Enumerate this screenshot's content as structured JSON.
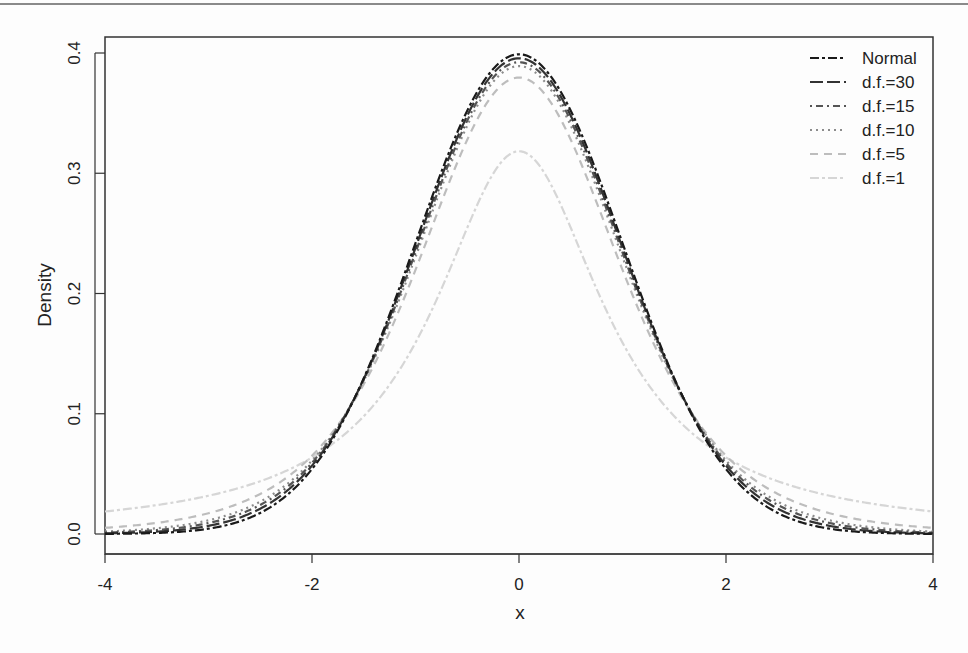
{
  "chart_data": {
    "type": "line",
    "title": "",
    "xlabel": "x",
    "ylabel": "Density",
    "xlim": [
      -4,
      4
    ],
    "ylim": [
      0,
      0.4
    ],
    "x_ticks": [
      "-4",
      "-2",
      "0",
      "2",
      "4"
    ],
    "y_ticks": [
      "0.0",
      "0.1",
      "0.2",
      "0.3",
      "0.4"
    ],
    "grid": false,
    "legend_position": "top-right (inside)",
    "x": [
      -4,
      -3.5,
      -3,
      -2.5,
      -2,
      -1.5,
      -1,
      -0.5,
      0,
      0.5,
      1,
      1.5,
      2,
      2.5,
      3,
      3.5,
      4
    ],
    "series": [
      {
        "name": "Normal",
        "df": null,
        "color": "#1a1a1a",
        "dash": "twodash",
        "values": [
          0.0001,
          0.0009,
          0.0044,
          0.0175,
          0.054,
          0.1295,
          0.242,
          0.3521,
          0.3989,
          0.3521,
          0.242,
          0.1295,
          0.054,
          0.0175,
          0.0044,
          0.0009,
          0.0001
        ]
      },
      {
        "name": "d.f.=30",
        "df": 30,
        "color": "#333333",
        "dash": "longdash",
        "values": [
          0.0005,
          0.0018,
          0.0064,
          0.0206,
          0.0566,
          0.129,
          0.2383,
          0.3478,
          0.3956,
          0.3478,
          0.2383,
          0.129,
          0.0566,
          0.0206,
          0.0064,
          0.0018,
          0.0005
        ]
      },
      {
        "name": "d.f.=15",
        "df": 15,
        "color": "#555555",
        "dash": "dotdash",
        "values": [
          0.001,
          0.003,
          0.0087,
          0.0236,
          0.0588,
          0.1283,
          0.2346,
          0.3438,
          0.3925,
          0.3438,
          0.2346,
          0.1283,
          0.0588,
          0.0236,
          0.0087,
          0.003,
          0.001
        ]
      },
      {
        "name": "d.f.=10",
        "df": 10,
        "color": "#8c8c8c",
        "dash": "dotted",
        "values": [
          0.002,
          0.0048,
          0.0114,
          0.0269,
          0.0611,
          0.1274,
          0.2304,
          0.3397,
          0.3891,
          0.3397,
          0.2304,
          0.1274,
          0.0611,
          0.0269,
          0.0114,
          0.0048,
          0.002
        ]
      },
      {
        "name": "d.f.=5",
        "df": 5,
        "color": "#bdbdbd",
        "dash": "dashed",
        "values": [
          0.0051,
          0.0091,
          0.0173,
          0.0335,
          0.0651,
          0.1245,
          0.2197,
          0.3279,
          0.3796,
          0.3279,
          0.2197,
          0.1245,
          0.0651,
          0.0335,
          0.0173,
          0.0091,
          0.0051
        ]
      },
      {
        "name": "d.f.=1",
        "df": 1,
        "color": "#d6d6d6",
        "dash": "twodash",
        "values": [
          0.0187,
          0.0241,
          0.0318,
          0.0439,
          0.0637,
          0.0979,
          0.1592,
          0.2546,
          0.3183,
          0.2546,
          0.1592,
          0.0979,
          0.0637,
          0.0439,
          0.0318,
          0.0241,
          0.0187
        ]
      }
    ]
  }
}
